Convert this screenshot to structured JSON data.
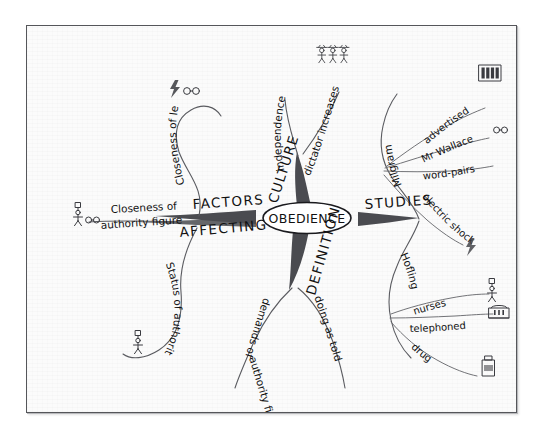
{
  "document": {
    "type": "hand-drawn mind map",
    "center_topic": "OBEDIENCE"
  },
  "center": {
    "label": "OBEDIENCE"
  },
  "main_branches": [
    {
      "id": "factors",
      "label_line1": "FACTORS",
      "label_line2": "AFFECTING",
      "direction": "left"
    },
    {
      "id": "culture",
      "label": "CULTURE",
      "direction": "up"
    },
    {
      "id": "studies",
      "label": "STUDIES",
      "direction": "right"
    },
    {
      "id": "definition",
      "label": "DEFINITION",
      "direction": "down"
    }
  ],
  "branches": {
    "factors": {
      "label": "FACTORS AFFECTING",
      "children": [
        {
          "label": "Closeness of learner",
          "icons": [
            "lightning-icon",
            "glasses-icon"
          ]
        },
        {
          "label": "Closeness of authority figure",
          "icons": [
            "person-icon",
            "glasses-icon"
          ]
        },
        {
          "label": "Status of authority figure",
          "icons": [
            "person-icon"
          ]
        }
      ]
    },
    "culture": {
      "label": "CULTURE",
      "children": [
        {
          "label": "independence",
          "icons": []
        },
        {
          "label": "dictator increases",
          "icons": [
            "three-people-icon"
          ]
        }
      ]
    },
    "studies": {
      "label": "STUDIES",
      "children": [
        {
          "label": "Milgram",
          "children": [
            {
              "label": "advertised",
              "icons": [
                "newspaper-icon"
              ]
            },
            {
              "label": "Mr Wallace",
              "icons": [
                "glasses-icon"
              ]
            },
            {
              "label": "word-pairs",
              "icons": []
            },
            {
              "label": "electric shock",
              "icons": [
                "lightning-icon"
              ]
            }
          ]
        },
        {
          "label": "Hofling",
          "children": [
            {
              "label": "nurses",
              "icons": [
                "person-icon"
              ]
            },
            {
              "label": "telephoned",
              "icons": [
                "telephone-icon"
              ]
            },
            {
              "label": "drug",
              "icons": [
                "drug-bottle-icon"
              ]
            }
          ]
        }
      ]
    },
    "definition": {
      "label": "DEFINITION",
      "children": [
        {
          "label": "demands of authority figure",
          "icons": []
        },
        {
          "label": "doing as told",
          "icons": []
        }
      ]
    }
  },
  "text": {
    "independence": "independence",
    "dictator_increases": "dictator increases",
    "culture": "CULTURE",
    "factors": "FACTORS",
    "affecting": "AFFECTING",
    "studies": "STUDIES",
    "definition": "DEFINITION",
    "closeness_learner": "Closeness of learner",
    "closeness_authority": "Closeness of",
    "closeness_authority2": "authority figure",
    "status_authority": "Status of authority figure",
    "demands_authority": "demands of",
    "demands_authority2": "authority figure",
    "doing_as_told": "doing as told",
    "milgram": "Milgram",
    "advertised": "advertised",
    "mr_wallace": "Mr Wallace",
    "word_pairs": "word-pairs",
    "electric_shock": "electric shock",
    "hofling": "Hofling",
    "nurses": "nurses",
    "telephoned": "telephoned",
    "drug": "drug"
  },
  "colors": {
    "paper": "#fbfbfb",
    "ink": "#111111",
    "branch": "#4a4b50",
    "frame": "#55565a"
  }
}
